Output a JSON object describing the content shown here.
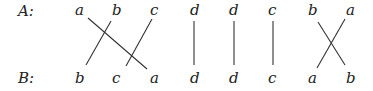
{
  "rows": {
    "top_label": "A:",
    "bottom_label": "B:"
  },
  "top": [
    "a",
    "b",
    "c",
    "d",
    "d",
    "c",
    "b",
    "a"
  ],
  "bottom": [
    "b",
    "c",
    "a",
    "d",
    "d",
    "c",
    "a",
    "b"
  ],
  "edges": [
    {
      "from_top": 0,
      "to_bottom": 2,
      "symbol": "a"
    },
    {
      "from_top": 1,
      "to_bottom": 0,
      "symbol": "b"
    },
    {
      "from_top": 2,
      "to_bottom": 1,
      "symbol": "c"
    },
    {
      "from_top": 3,
      "to_bottom": 3,
      "symbol": "d"
    },
    {
      "from_top": 4,
      "to_bottom": 4,
      "symbol": "d"
    },
    {
      "from_top": 5,
      "to_bottom": 5,
      "symbol": "c"
    },
    {
      "from_top": 6,
      "to_bottom": 7,
      "symbol": "b"
    },
    {
      "from_top": 7,
      "to_bottom": 6,
      "symbol": "a"
    }
  ]
}
